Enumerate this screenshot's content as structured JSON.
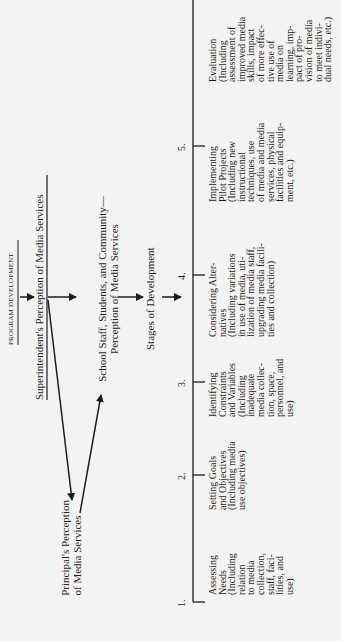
{
  "title": "PROGRAM DEVELOPMENT",
  "flow": {
    "superintendent": "Superintendent's Perception of Media Services",
    "principal": [
      "Principal's Perception",
      "of Media Services"
    ],
    "community": [
      "School Staff, Students, and Community—",
      "Perception of Media Services"
    ],
    "stages_heading": "Stages of Development"
  },
  "stages": [
    {
      "number": "1.",
      "text": "Assessing\nNeeds\n(Including\nrelation\nto media\ncollection,\nstaff, faci-\nlities, and\nuse)"
    },
    {
      "number": "2.",
      "text": "Setting Goals\nand Objectives\n(Including media\nuse objectives)"
    },
    {
      "number": "3.",
      "text": "Identifying\nConstraints\nand Variables\n(Including\ninadequate\nmedia collec-\ntion, space,\npersonnel, and\nuse)"
    },
    {
      "number": "4.",
      "text": "Considering Alter-\nnatives\n(Including variations\nin use of media, uti-\nlization of media staff,\nupgrading media facili-\nties and collection)"
    },
    {
      "number": "5.",
      "text": "Implementing\nPilot Projects\n(Including new\ninstructional\ntechniques, use\nof media and media\nservices, physical\nfacilities and equip-\nment, etc.)"
    },
    {
      "number": "",
      "text": "Evaluation\n(Including\nassessment of\nimproved media\nskills, impact\nof more effec-\ntive use of\nmedia on\nlearning, imp-\npact of pro-\nvision of media\nto meet indivi-\ndual needs, etc.)"
    }
  ]
}
